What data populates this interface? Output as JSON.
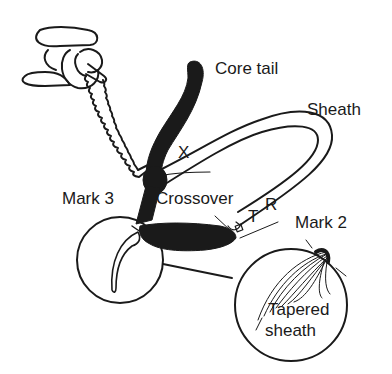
{
  "diagram": {
    "colors": {
      "ink": "#1a1a1a",
      "background": "#ffffff"
    },
    "labels": {
      "core_tail": "Core tail",
      "sheath": "Sheath",
      "x_mark": "X",
      "crossover": "Crossover",
      "mark3": "Mark 3",
      "mark2": "Mark 2",
      "t_mark": "T",
      "r_mark": "R",
      "tapered_line1": "Tapered",
      "tapered_line2": "sheath"
    }
  }
}
